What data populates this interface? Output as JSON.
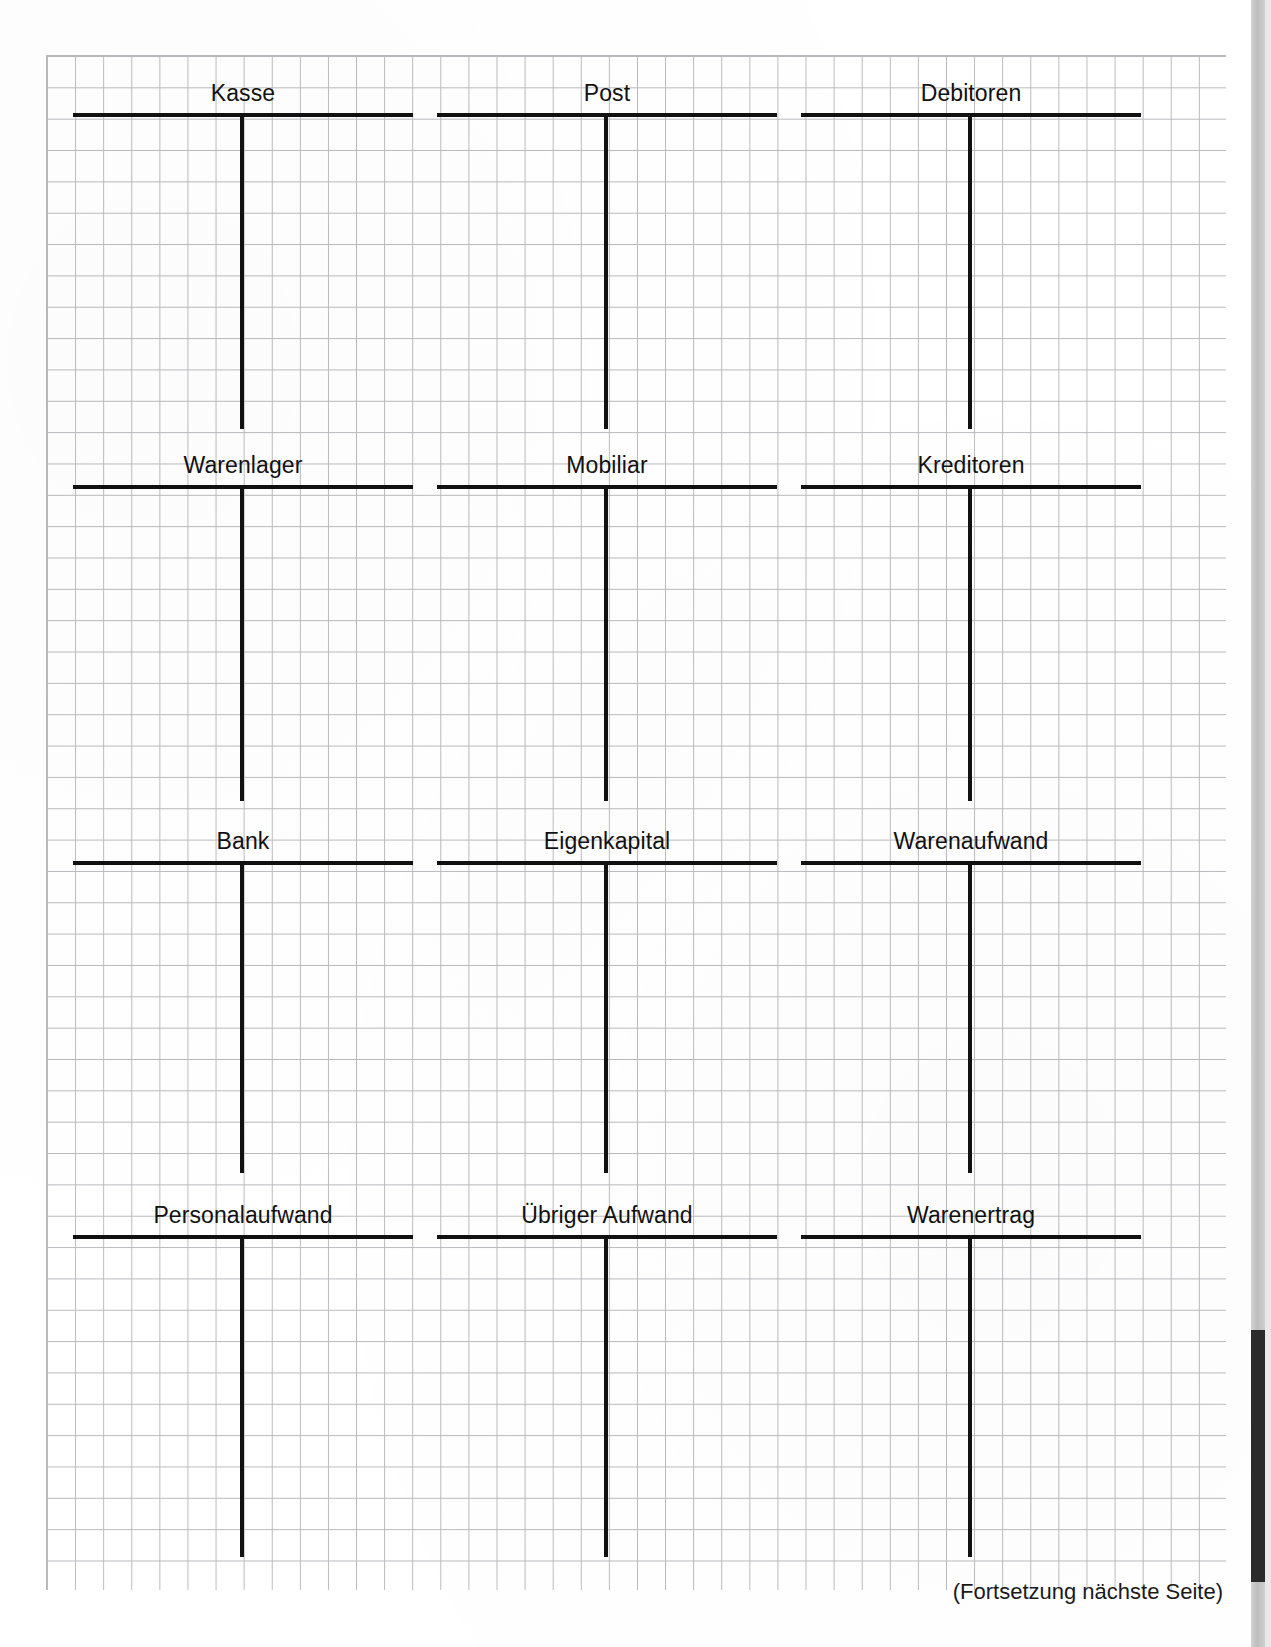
{
  "document": {
    "title": "T-Konten Arbeitsblatt",
    "continuation_note": "(Fortsetzung nächste Seite)"
  },
  "layout": {
    "columns": 3,
    "rows": 4,
    "grid_cell_width_px": 28,
    "grid_cell_height_px": 31,
    "rule_color": "#111111",
    "grid_color": "#b9b9bd",
    "paper_color": "#ffffff"
  },
  "accounts": [
    {
      "label": "Kasse",
      "row": 1,
      "column": 1,
      "left": 73,
      "top": 82,
      "stem_height": 312
    },
    {
      "label": "Post",
      "row": 1,
      "column": 2,
      "left": 437,
      "top": 82,
      "stem_height": 312
    },
    {
      "label": "Debitoren",
      "row": 1,
      "column": 3,
      "left": 801,
      "top": 82,
      "stem_height": 312
    },
    {
      "label": "Warenlager",
      "row": 2,
      "column": 1,
      "left": 73,
      "top": 454,
      "stem_height": 312
    },
    {
      "label": "Mobiliar",
      "row": 2,
      "column": 2,
      "left": 437,
      "top": 454,
      "stem_height": 312
    },
    {
      "label": "Kreditoren",
      "row": 2,
      "column": 3,
      "left": 801,
      "top": 454,
      "stem_height": 312
    },
    {
      "label": "Bank",
      "row": 3,
      "column": 1,
      "left": 73,
      "top": 830,
      "stem_height": 308
    },
    {
      "label": "Eigenkapital",
      "row": 3,
      "column": 2,
      "left": 437,
      "top": 830,
      "stem_height": 308
    },
    {
      "label": "Warenaufwand",
      "row": 3,
      "column": 3,
      "left": 801,
      "top": 830,
      "stem_height": 308
    },
    {
      "label": "Personalaufwand",
      "row": 4,
      "column": 1,
      "left": 73,
      "top": 1204,
      "stem_height": 318
    },
    {
      "label": "Übriger Aufwand",
      "row": 4,
      "column": 2,
      "left": 437,
      "top": 1204,
      "stem_height": 318
    },
    {
      "label": "Warenertrag",
      "row": 4,
      "column": 3,
      "left": 801,
      "top": 1204,
      "stem_height": 318
    }
  ]
}
